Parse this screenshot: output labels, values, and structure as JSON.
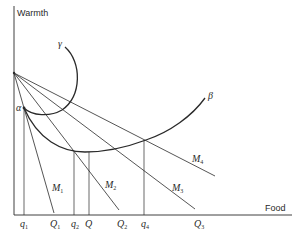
{
  "diagram": {
    "axes": {
      "y_label": "Warmth",
      "x_label": "Food"
    },
    "curves": {
      "gamma": "γ",
      "beta": "β",
      "alpha": "α"
    },
    "lines": [
      {
        "name": "M",
        "sub": "1"
      },
      {
        "name": "M",
        "sub": "2"
      },
      {
        "name": "M",
        "sub": "3"
      },
      {
        "name": "M",
        "sub": "4"
      }
    ],
    "x_ticks": [
      {
        "name": "q",
        "sub": "1"
      },
      {
        "name": "Q",
        "sub": "1"
      },
      {
        "name": "q",
        "sub": "2"
      },
      {
        "name": "Q",
        "sub": ""
      },
      {
        "name": "Q",
        "sub": "2"
      },
      {
        "name": "q",
        "sub": "4"
      },
      {
        "name": "Q",
        "sub": "3"
      }
    ],
    "colors": {
      "line": "#2a2a2a",
      "background": "#ffffff"
    }
  }
}
